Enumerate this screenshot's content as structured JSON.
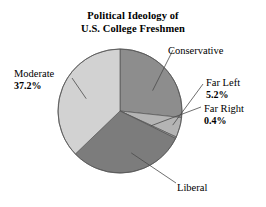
{
  "title": {
    "line1": "Political Ideology of",
    "line2": "U.S. College Freshmen"
  },
  "colors": {
    "background": "#ffffff",
    "text": "#000000",
    "leader_line": "#4a4a4a",
    "outline": "#555555",
    "moderate": "#d2d2d2",
    "conservative": "#8d8d8d",
    "far_left": "#b4b4b4",
    "far_right": "#9a9a9a",
    "liberal": "#7c7c7c"
  },
  "labels": {
    "conservative": {
      "name": "Conservative",
      "pct": ""
    },
    "far_left": {
      "name": "Far Left",
      "pct": "5.2%"
    },
    "far_right": {
      "name": "Far Right",
      "pct": "0.4%"
    },
    "moderate": {
      "name": "Moderate",
      "pct": "37.2%"
    },
    "liberal": {
      "name": "Liberal",
      "pct": ""
    }
  },
  "chart_data": {
    "type": "pie",
    "title": "Political Ideology of U.S. College Freshmen",
    "xlabel": "",
    "ylabel": "",
    "grid": false,
    "legend": "none (direct labels with leader lines)",
    "units": "percent",
    "start_angle_deg": 0,
    "direction": "clockwise",
    "center": {
      "x": 120,
      "y": 111
    },
    "radius": 62,
    "categories": [
      "Conservative",
      "Far Left",
      "Far Right",
      "Liberal",
      "Moderate"
    ],
    "values": [
      26.7,
      5.2,
      0.4,
      30.5,
      37.2
    ],
    "slices": [
      {
        "label": "Conservative",
        "value": 26.7,
        "pct_shown": "",
        "color": "#8d8d8d",
        "start_deg": 0.0,
        "end_deg": 96.1
      },
      {
        "label": "Far Left",
        "value": 5.2,
        "pct_shown": "5.2%",
        "color": "#b4b4b4",
        "start_deg": 96.1,
        "end_deg": 114.8
      },
      {
        "label": "Far Right",
        "value": 0.4,
        "pct_shown": "0.4%",
        "color": "#9a9a9a",
        "start_deg": 114.8,
        "end_deg": 116.3
      },
      {
        "label": "Liberal",
        "value": 30.5,
        "pct_shown": "",
        "color": "#7c7c7c",
        "start_deg": 116.3,
        "end_deg": 226.1
      },
      {
        "label": "Moderate",
        "value": 37.2,
        "pct_shown": "37.2%",
        "color": "#d2d2d2",
        "start_deg": 226.1,
        "end_deg": 360.0
      }
    ]
  }
}
